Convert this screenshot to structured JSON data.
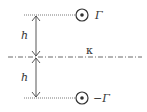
{
  "diagram": {
    "labels": {
      "top_vortex": "Γ",
      "bottom_vortex": "−Γ",
      "distance_top": "h",
      "distance_bottom": "h",
      "kappa": "κ"
    },
    "colors": {
      "stroke": "#333333",
      "dotted": "#555555"
    }
  }
}
